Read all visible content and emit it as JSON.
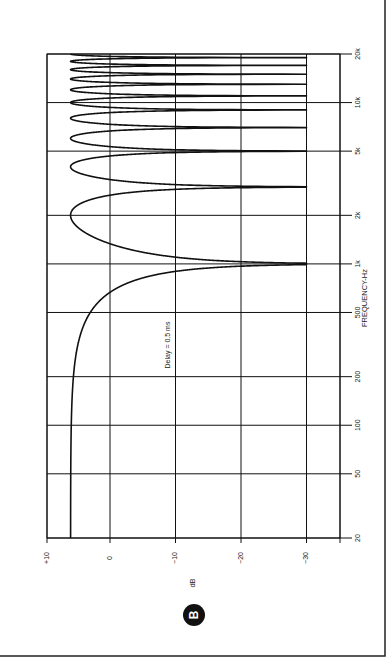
{
  "figure": {
    "panel_label": "B",
    "rotation_deg": -90
  },
  "chart_data": {
    "type": "line",
    "title": "",
    "panel_label": "B",
    "xlabel": "FREQUENCY-Hz",
    "ylabel": "dB",
    "x_scale": "log",
    "xlim": [
      20,
      20000
    ],
    "ylim": [
      -30,
      10
    ],
    "x_ticks": [
      20,
      50,
      100,
      200,
      500,
      1000,
      2000,
      5000,
      10000,
      20000
    ],
    "x_tick_labels": [
      "20",
      "50",
      "100",
      "200",
      "500",
      "1k",
      "2k",
      "5k",
      "10k",
      "20k"
    ],
    "y_ticks": [
      10,
      0,
      -10,
      -20,
      -30
    ],
    "y_tick_labels": [
      "+10",
      "0",
      "−10",
      "−20",
      "−30"
    ],
    "grid": true,
    "annotations": [
      {
        "text": "Delay = 0.5 ms"
      }
    ],
    "series": [
      {
        "name": "Comb filter response",
        "model": "20*log10(|2*cos(pi*f*delay)|)",
        "delay_s": 0.0005,
        "floor_db": -30,
        "peak_db": 6,
        "null_frequencies_hz": [
          1000,
          3000,
          5000,
          7000,
          9000,
          11000,
          13000,
          15000,
          17000,
          19000
        ],
        "peak_frequencies_hz": [
          0,
          2000,
          4000,
          6000,
          8000,
          10000,
          12000,
          14000,
          16000,
          18000,
          20000
        ],
        "sample_points": [
          {
            "f": 20,
            "db": 6.0
          },
          {
            "f": 100,
            "db": 5.96
          },
          {
            "f": 200,
            "db": 5.85
          },
          {
            "f": 500,
            "db": 3.0
          },
          {
            "f": 700,
            "db": -1.1
          },
          {
            "f": 900,
            "db": -10.1
          },
          {
            "f": 1000,
            "db": -30
          },
          {
            "f": 1500,
            "db": 3.0
          },
          {
            "f": 2000,
            "db": 6.0
          },
          {
            "f": 3000,
            "db": -30
          },
          {
            "f": 4000,
            "db": 6.0
          },
          {
            "f": 5000,
            "db": -30
          },
          {
            "f": 6000,
            "db": 6.0
          },
          {
            "f": 7000,
            "db": -30
          },
          {
            "f": 8000,
            "db": 6.0
          },
          {
            "f": 9000,
            "db": -30
          },
          {
            "f": 10000,
            "db": 6.0
          },
          {
            "f": 20000,
            "db": 6.0
          }
        ]
      }
    ]
  }
}
